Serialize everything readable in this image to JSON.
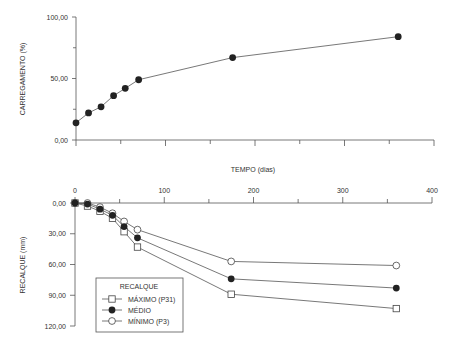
{
  "chart_data": [
    {
      "type": "line",
      "title": "",
      "xlabel": "",
      "ylabel": "CARREGAMENTO (%)",
      "xlim": [
        0,
        400
      ],
      "ylim": [
        0,
        100
      ],
      "yticks": [
        "0,00",
        "50,00",
        "100,00"
      ],
      "yticks_values": [
        0,
        50,
        100
      ],
      "grid": false,
      "series": [
        {
          "name": "Carregamento",
          "marker": "filled-circle",
          "x": [
            0,
            14,
            28,
            42,
            55,
            70,
            175,
            360
          ],
          "y": [
            14,
            22,
            27,
            36,
            42,
            49,
            67,
            84
          ]
        }
      ]
    },
    {
      "type": "line",
      "title": "",
      "xlabel": "TEMPO (dias)",
      "ylabel": "RECALQUE (mm)",
      "xlim": [
        0,
        400
      ],
      "ylim": [
        0,
        120
      ],
      "y_inverted": true,
      "xticks": [
        "0",
        "100",
        "200",
        "300",
        "400"
      ],
      "xticks_values": [
        0,
        100,
        200,
        300,
        400
      ],
      "yticks": [
        "0,00",
        "30,00",
        "60,00",
        "90,00",
        "120,00"
      ],
      "yticks_values": [
        0,
        30,
        60,
        90,
        120
      ],
      "grid": false,
      "legend": {
        "title": "RECALQUE",
        "position": "bottom-left"
      },
      "series": [
        {
          "name": "MÁXIMO (P31)",
          "marker": "open-square",
          "x": [
            0,
            14,
            28,
            42,
            55,
            70,
            175,
            360
          ],
          "y": [
            0,
            3,
            8,
            15,
            28,
            43,
            89,
            103
          ]
        },
        {
          "name": "MÉDIO",
          "marker": "filled-circle",
          "x": [
            0,
            14,
            28,
            42,
            55,
            70,
            175,
            360
          ],
          "y": [
            0,
            1,
            6,
            12,
            23,
            34,
            74,
            83
          ]
        },
        {
          "name": "MÍNIMO (P3)",
          "marker": "open-circle",
          "x": [
            0,
            14,
            28,
            42,
            55,
            70,
            175,
            360
          ],
          "y": [
            0,
            0,
            4,
            10,
            18,
            26,
            57,
            61
          ]
        }
      ]
    }
  ]
}
